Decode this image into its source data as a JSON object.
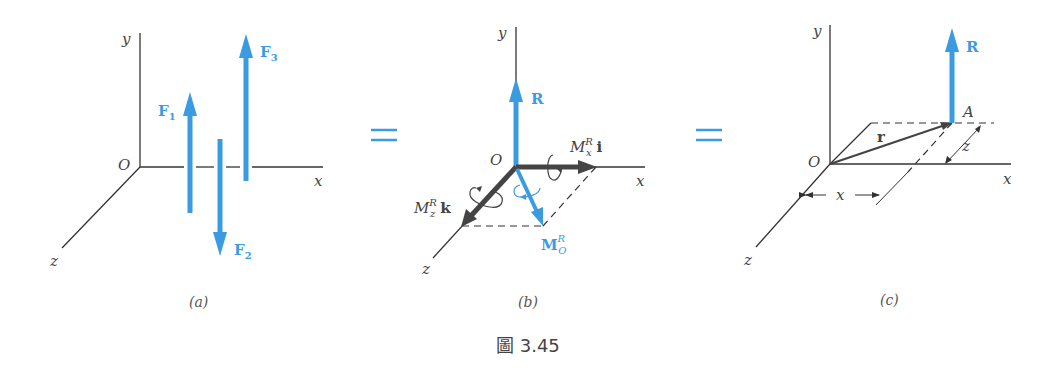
{
  "figure": {
    "caption": "圖 3.45",
    "colors": {
      "force_blue": "#3b9be0",
      "moment_dark": "#444444",
      "axis": "#333333"
    },
    "equals_sign": "=",
    "panels": [
      {
        "id": "a",
        "label": "(a)",
        "axes": {
          "x": "x",
          "y": "y",
          "z": "z",
          "origin": "O"
        },
        "forces": [
          {
            "name": "F",
            "sub": "1",
            "direction": "up"
          },
          {
            "name": "F",
            "sub": "2",
            "direction": "down"
          },
          {
            "name": "F",
            "sub": "3",
            "direction": "up"
          }
        ]
      },
      {
        "id": "b",
        "label": "(b)",
        "axes": {
          "x": "x",
          "y": "y",
          "z": "z",
          "origin": "O"
        },
        "resultant": "R",
        "moments": {
          "mx": {
            "base": "M",
            "sup": "R",
            "sub": "x",
            "unit": "i"
          },
          "mz": {
            "base": "M",
            "sup": "R",
            "sub": "z",
            "unit": "k"
          },
          "mo": {
            "base": "M",
            "sup": "R",
            "sub": "O"
          }
        }
      },
      {
        "id": "c",
        "label": "(c)",
        "axes": {
          "x": "x",
          "y": "y",
          "z": "z",
          "origin": "O"
        },
        "resultant": "R",
        "point": "A",
        "position_vector": "r",
        "dim_x": "x",
        "dim_z": "z"
      }
    ]
  }
}
